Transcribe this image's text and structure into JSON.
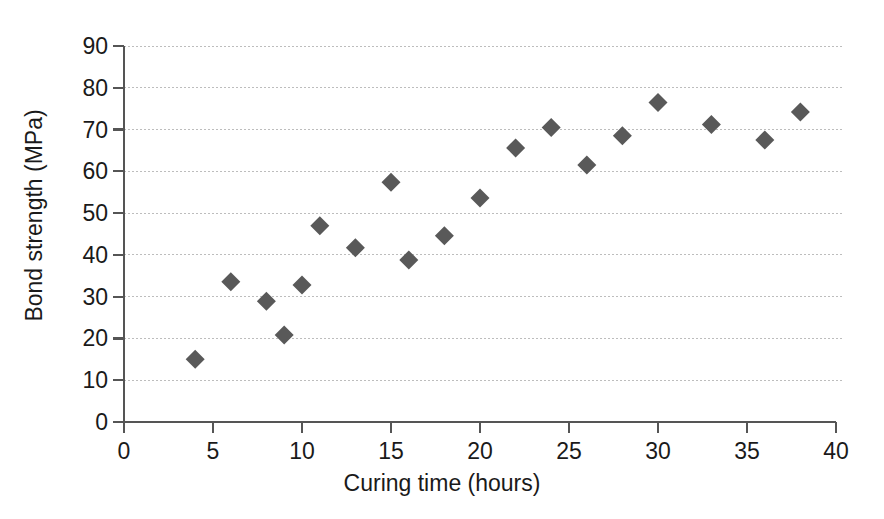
{
  "chart_data": {
    "type": "scatter",
    "title": "",
    "xlabel": "Curing time (hours)",
    "ylabel": "Bond strength (MPa)",
    "xlim": [
      0,
      40
    ],
    "ylim": [
      0,
      90
    ],
    "xticks": [
      0,
      5,
      10,
      15,
      20,
      25,
      30,
      35,
      40
    ],
    "yticks": [
      0,
      10,
      20,
      30,
      40,
      50,
      60,
      70,
      80,
      90
    ],
    "grid": "horizontal-dotted",
    "legend": "none",
    "marker": "diamond",
    "marker_color": "#595959",
    "series": [
      {
        "name": "Bond strength",
        "points": [
          {
            "x": 4,
            "y": 15.0
          },
          {
            "x": 6,
            "y": 33.6
          },
          {
            "x": 8,
            "y": 28.9
          },
          {
            "x": 9,
            "y": 20.8
          },
          {
            "x": 10,
            "y": 32.8
          },
          {
            "x": 11,
            "y": 47.0
          },
          {
            "x": 13,
            "y": 41.7
          },
          {
            "x": 15,
            "y": 57.4
          },
          {
            "x": 16,
            "y": 38.8
          },
          {
            "x": 18,
            "y": 44.6
          },
          {
            "x": 20,
            "y": 53.6
          },
          {
            "x": 22,
            "y": 65.6
          },
          {
            "x": 24,
            "y": 70.5
          },
          {
            "x": 26,
            "y": 61.5
          },
          {
            "x": 28,
            "y": 68.5
          },
          {
            "x": 30,
            "y": 76.5
          },
          {
            "x": 33,
            "y": 71.2
          },
          {
            "x": 36,
            "y": 67.5
          },
          {
            "x": 38,
            "y": 74.2
          }
        ]
      }
    ]
  },
  "axes": {
    "x_tick_labels": [
      "0",
      "5",
      "10",
      "15",
      "20",
      "25",
      "30",
      "35",
      "40"
    ],
    "y_tick_labels": [
      "0",
      "10",
      "20",
      "30",
      "40",
      "50",
      "60",
      "70",
      "80",
      "90"
    ],
    "x_title": "Curing time (hours)",
    "y_title": "Bond strength (MPa)"
  },
  "style": {
    "axis_color": "#555555",
    "grid_color": "#bdbdbd",
    "marker_color": "#595959",
    "background": "#ffffff"
  }
}
